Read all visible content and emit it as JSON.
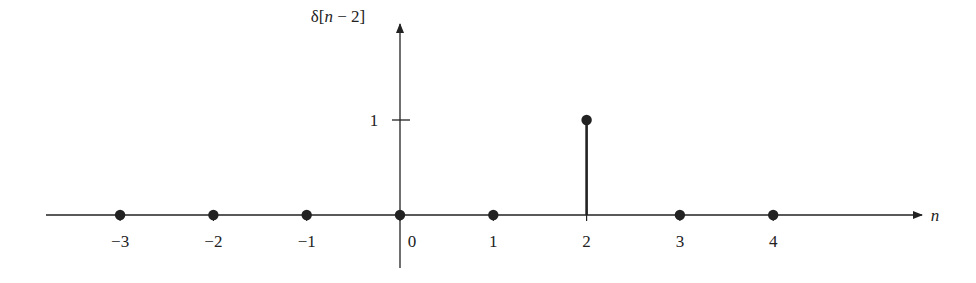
{
  "chart_data": {
    "type": "stem",
    "title": "",
    "ylabel": "δ[n − 2]",
    "xlabel": "n",
    "x": [
      -3,
      -2,
      -1,
      0,
      1,
      2,
      3,
      4
    ],
    "values": [
      0,
      0,
      0,
      0,
      0,
      1,
      0,
      0
    ],
    "categories": [
      "−3",
      "−2",
      "−1",
      "0",
      "1",
      "2",
      "3",
      "4"
    ],
    "yticks": [
      {
        "value": 1,
        "label": "1"
      }
    ],
    "xlim": [
      -3.8,
      5.6
    ],
    "ylim": [
      -0.55,
      2.0
    ],
    "grid": false,
    "legend": null
  },
  "colors": {
    "ink": "#222222",
    "background": "#ffffff"
  },
  "labels": {
    "ylabel_delta": "δ[",
    "ylabel_n": "n",
    "ylabel_rest": " − 2]",
    "xlabel": "n",
    "ytick_1": "1"
  }
}
